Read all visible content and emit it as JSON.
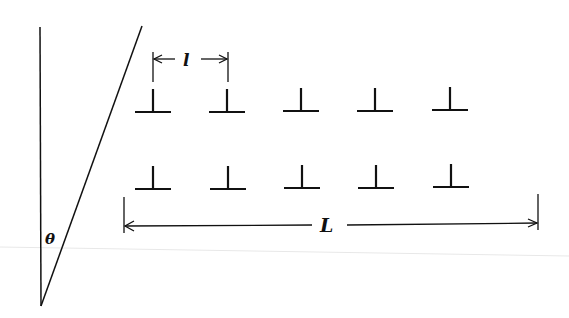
{
  "diagram": {
    "angle_label": "θ",
    "spacing_label": "l",
    "length_label": "L",
    "rows": 2,
    "columns": 5,
    "dislocation_symbol": "⊥",
    "stroke_color": "#111111",
    "faint_line_color": "#e6e6e6",
    "dislocations": [
      {
        "x": 153,
        "y": 112
      },
      {
        "x": 227,
        "y": 112
      },
      {
        "x": 301,
        "y": 111
      },
      {
        "x": 375,
        "y": 111
      },
      {
        "x": 450,
        "y": 110
      },
      {
        "x": 153,
        "y": 189
      },
      {
        "x": 228,
        "y": 189
      },
      {
        "x": 302,
        "y": 188
      },
      {
        "x": 376,
        "y": 188
      },
      {
        "x": 451,
        "y": 187
      }
    ]
  }
}
